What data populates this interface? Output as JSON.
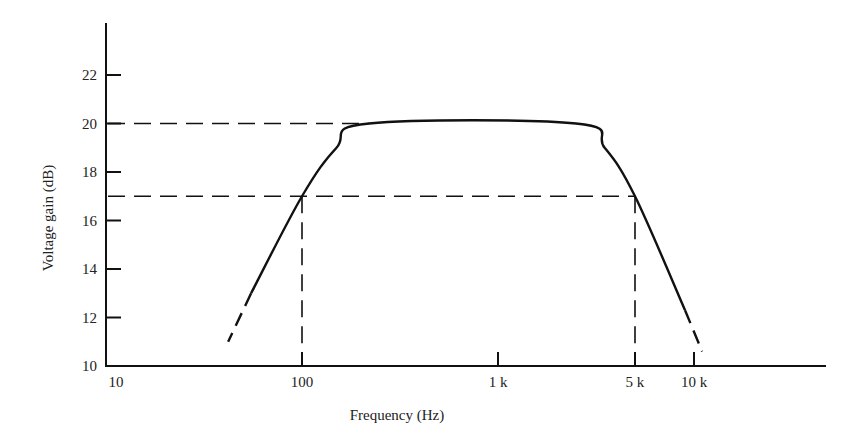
{
  "chart_data": {
    "type": "line",
    "title": "",
    "xlabel": "Frequency (Hz)",
    "ylabel": "Voltage gain (dB)",
    "xscale": "log",
    "xlim": [
      10,
      40000
    ],
    "ylim": [
      10,
      24
    ],
    "x_ticks": [
      {
        "value": 10,
        "label": "10"
      },
      {
        "value": 100,
        "label": "100"
      },
      {
        "value": 1000,
        "label": "1 k"
      },
      {
        "value": 5000,
        "label": "5 k"
      },
      {
        "value": 10000,
        "label": "10 k"
      }
    ],
    "y_ticks": [
      10,
      12,
      14,
      16,
      18,
      20,
      22
    ],
    "grid": false,
    "series": [
      {
        "name": "Frequency response",
        "style": "solid",
        "points": [
          {
            "x": 55,
            "y": 13.0
          },
          {
            "x": 100,
            "y": 17.0
          },
          {
            "x": 150,
            "y": 19.0
          },
          {
            "x": 220,
            "y": 20.0
          },
          {
            "x": 2500,
            "y": 20.0
          },
          {
            "x": 3500,
            "y": 19.0
          },
          {
            "x": 5000,
            "y": 17.0
          },
          {
            "x": 9000,
            "y": 12.3
          }
        ]
      },
      {
        "name": "Low-frequency extrapolation",
        "style": "dashed",
        "points": [
          {
            "x": 55,
            "y": 13.0
          },
          {
            "x": 42,
            "y": 11.0
          }
        ]
      },
      {
        "name": "High-frequency extrapolation",
        "style": "dashed",
        "points": [
          {
            "x": 9000,
            "y": 12.3
          },
          {
            "x": 11000,
            "y": 10.6
          }
        ]
      }
    ],
    "annotations": [
      {
        "type": "hline-dashed",
        "y": 20,
        "x_from": 10,
        "x_to": 220,
        "label": "midband gain 20 dB"
      },
      {
        "type": "hline-dashed",
        "y": 17,
        "x_from": 10,
        "x_to": 5000,
        "label": "-3 dB level 17 dB"
      },
      {
        "type": "vline-dashed",
        "x": 100,
        "y_from": 10,
        "y_to": 17,
        "label": "lower cutoff 100 Hz"
      },
      {
        "type": "vline-dashed",
        "x": 5000,
        "y_from": 10,
        "y_to": 17,
        "label": "upper cutoff 5 kHz"
      }
    ]
  },
  "colors": {
    "line": "#111111",
    "text": "#222222",
    "background": "#ffffff"
  }
}
